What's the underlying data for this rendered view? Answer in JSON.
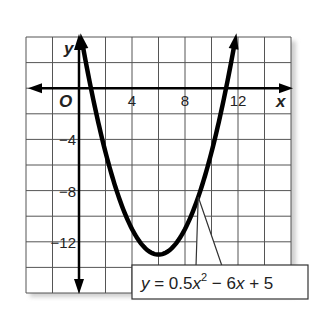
{
  "chart_data": {
    "type": "line",
    "title": "",
    "equation": {
      "y": "y",
      "eq": " = 0.5",
      "x1": "x",
      "sup": "2",
      "rest1": " − 6",
      "x2": "x",
      "rest2": " + 5"
    },
    "coefficients": {
      "a": 0.5,
      "b": -6,
      "c": 5
    },
    "xlim": [
      -4,
      16
    ],
    "ylim": [
      -16,
      4
    ],
    "grid_step": 2,
    "grid": true,
    "xlabel": "x",
    "ylabel": "y",
    "origin_label": "O",
    "x_ticks": [
      {
        "value": 4,
        "label": "4"
      },
      {
        "value": 8,
        "label": "8"
      },
      {
        "value": 12,
        "label": "12"
      }
    ],
    "y_ticks": [
      {
        "value": -4,
        "label": "−4"
      },
      {
        "value": -8,
        "label": "−8"
      },
      {
        "value": -12,
        "label": "−12"
      }
    ],
    "vertex": [
      6,
      -13
    ],
    "callout_point_x": 9.0
  }
}
